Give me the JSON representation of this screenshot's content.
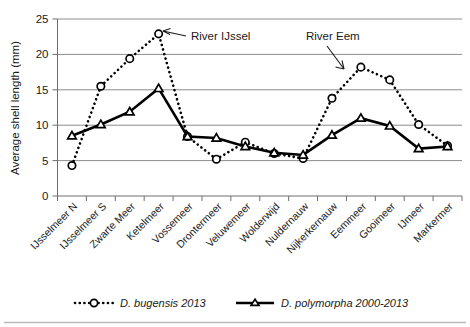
{
  "chart_data": {
    "type": "line",
    "title": "",
    "xlabel": "",
    "ylabel": "Average shell length (mm)",
    "ylim": [
      0,
      25
    ],
    "yticks": [
      0,
      5,
      10,
      15,
      20,
      25
    ],
    "grid": true,
    "legend_position": "bottom",
    "categories": [
      "IJsselmeer N",
      "IJsselmeer S",
      "Zwarte Meer",
      "Ketelmeer",
      "Vossemeer",
      "Drontermeer",
      "Veluwemeer",
      "Wolderwijd",
      "Nuldernauw",
      "Nijkerkernauw",
      "Eemmeer",
      "Gooimeer",
      "IJmeer",
      "Markermer"
    ],
    "series": [
      {
        "name": "D. bugensis 2013",
        "marker": "open-circle",
        "line_style": "dotted",
        "values": [
          4.3,
          15.5,
          19.4,
          22.9,
          8.4,
          5.2,
          7.6,
          6.0,
          5.3,
          13.8,
          18.2,
          16.4,
          10.1,
          7.1
        ]
      },
      {
        "name": "D. polymorpha 2000-2013",
        "marker": "open-triangle",
        "line_style": "solid",
        "values": [
          8.5,
          10.1,
          11.9,
          15.2,
          8.4,
          8.2,
          7.0,
          6.1,
          5.8,
          8.6,
          11.0,
          9.9,
          6.7,
          7.0
        ]
      }
    ],
    "annotations": [
      {
        "text": "River IJssel",
        "points_to_category": "Ketelmeer"
      },
      {
        "text": "River Eem",
        "points_to_category": "Eemmeer"
      }
    ]
  },
  "legend": {
    "items": [
      {
        "label": "D. bugensis 2013"
      },
      {
        "label": "D. polymorpha 2000-2013"
      }
    ]
  },
  "axis": {
    "y_title": "Average shell length (mm)",
    "y_tick_labels": [
      "0",
      "5",
      "10",
      "15",
      "20",
      "25"
    ]
  },
  "annotations": {
    "river_ijssel": "River IJssel",
    "river_eem": "River Eem"
  },
  "colors": {
    "line": "#000000",
    "grid": "#8c8c8c",
    "text": "#1a1a1a",
    "background": "#ffffff"
  }
}
